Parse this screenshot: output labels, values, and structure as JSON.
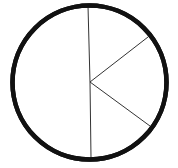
{
  "diagram": {
    "type": "circle-divided-into-sectors",
    "circle": {
      "cx": 89.5,
      "cy": 82.5,
      "r": 77,
      "stroke": "#111111",
      "stroke_width": 4.5,
      "fill": "#ffffff"
    },
    "center": {
      "x": 90,
      "y": 82
    },
    "dividers": [
      {
        "name": "top-radius",
        "x1": 88,
        "y1": 6,
        "x2": 90,
        "y2": 82
      },
      {
        "name": "bottom-radius",
        "x1": 90,
        "y1": 82,
        "x2": 91,
        "y2": 158
      },
      {
        "name": "upper-right-radius",
        "x1": 90,
        "y1": 82,
        "x2": 148,
        "y2": 37
      },
      {
        "name": "lower-right-radius",
        "x1": 90,
        "y1": 82,
        "x2": 150,
        "y2": 126
      }
    ],
    "line_color": "#333333",
    "line_width": 1,
    "sectors": [
      {
        "name": "left-half",
        "approx_degrees": 180
      },
      {
        "name": "upper-right",
        "approx_degrees": 52
      },
      {
        "name": "right-middle",
        "approx_degrees": 74
      },
      {
        "name": "lower-right",
        "approx_degrees": 54
      }
    ]
  }
}
